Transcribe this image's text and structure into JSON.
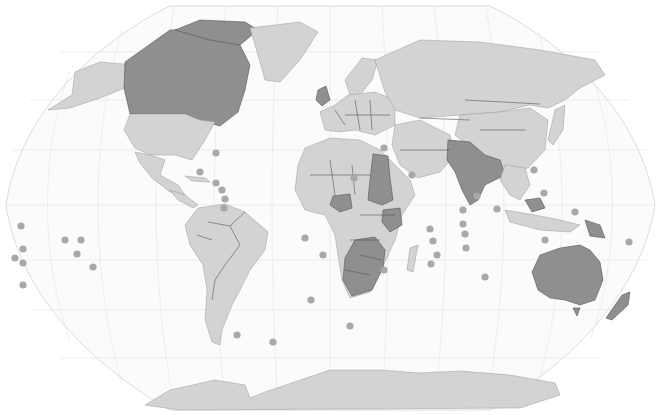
{
  "map": {
    "projection": "robinson",
    "width": 661,
    "height": 415,
    "colors": {
      "ocean": "#fbfbfb",
      "graticule": "#e6e6e6",
      "land_light": "#d3d3d3",
      "land_dark": "#8f8f8f",
      "border": "#555555",
      "dot": "#a9a9a9"
    },
    "highlighted_regions": [
      "Canada",
      "Pakistan",
      "India",
      "Bangladesh",
      "Nepal",
      "Sri Lanka",
      "Myanmar",
      "Sudan",
      "South Sudan",
      "Egypt",
      "Nigeria",
      "Ghana",
      "Sierra Leone",
      "Gambia",
      "Cameroon",
      "Uganda",
      "Kenya",
      "Tanzania",
      "Zambia",
      "Malawi",
      "Zimbabwe",
      "Botswana",
      "Namibia",
      "South Africa",
      "Lesotho",
      "Swaziland",
      "Mozambique",
      "Australia",
      "New Zealand",
      "Papua New Guinea",
      "Malaysia",
      "Singapore",
      "Brunei",
      "United Kingdom",
      "Ireland",
      "Jamaica",
      "Trinidad and Tobago",
      "Guyana"
    ],
    "island_markers": [
      {
        "x": 21,
        "y": 226
      },
      {
        "x": 23,
        "y": 249
      },
      {
        "x": 15,
        "y": 258
      },
      {
        "x": 23,
        "y": 263
      },
      {
        "x": 23,
        "y": 285
      },
      {
        "x": 65,
        "y": 240
      },
      {
        "x": 81,
        "y": 240
      },
      {
        "x": 77,
        "y": 254
      },
      {
        "x": 93,
        "y": 267
      },
      {
        "x": 216,
        "y": 153
      },
      {
        "x": 200,
        "y": 172
      },
      {
        "x": 216,
        "y": 183
      },
      {
        "x": 222,
        "y": 190
      },
      {
        "x": 225,
        "y": 199
      },
      {
        "x": 224,
        "y": 208
      },
      {
        "x": 305,
        "y": 238
      },
      {
        "x": 323,
        "y": 255
      },
      {
        "x": 311,
        "y": 300
      },
      {
        "x": 237,
        "y": 335
      },
      {
        "x": 273,
        "y": 342
      },
      {
        "x": 384,
        "y": 148
      },
      {
        "x": 412,
        "y": 175
      },
      {
        "x": 354,
        "y": 178
      },
      {
        "x": 430,
        "y": 229
      },
      {
        "x": 433,
        "y": 241
      },
      {
        "x": 437,
        "y": 255
      },
      {
        "x": 431,
        "y": 264
      },
      {
        "x": 463,
        "y": 210
      },
      {
        "x": 463,
        "y": 224
      },
      {
        "x": 477,
        "y": 196
      },
      {
        "x": 497,
        "y": 209
      },
      {
        "x": 465,
        "y": 234
      },
      {
        "x": 466,
        "y": 248
      },
      {
        "x": 384,
        "y": 270
      },
      {
        "x": 485,
        "y": 277
      },
      {
        "x": 350,
        "y": 326
      },
      {
        "x": 545,
        "y": 240
      },
      {
        "x": 629,
        "y": 242
      },
      {
        "x": 534,
        "y": 170
      },
      {
        "x": 544,
        "y": 193
      },
      {
        "x": 575,
        "y": 212
      }
    ]
  }
}
